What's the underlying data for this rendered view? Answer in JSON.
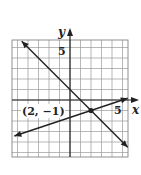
{
  "chart_data": {
    "type": "line",
    "title": "",
    "xlabel": "x",
    "ylabel": "y",
    "xlim": [
      -5.5,
      5.5
    ],
    "ylim": [
      -5.4,
      5.7
    ],
    "grid": true,
    "tick_labels": {
      "x": [
        "5"
      ],
      "y": [
        "5"
      ]
    },
    "series": [
      {
        "name": "line-decreasing",
        "equation": "y = -x + 1",
        "x": [
          -4.6,
          2,
          5.5
        ],
        "y": [
          5.6,
          -1,
          -4.5
        ]
      },
      {
        "name": "line-increasing",
        "equation": "y = (x - 5)/3",
        "x": [
          -5.3,
          2,
          5.5
        ],
        "y": [
          -3.43,
          -1,
          0.17
        ]
      }
    ],
    "annotations": [
      {
        "text": "(2, −1)",
        "x": 2,
        "y": -1,
        "marker": "point"
      }
    ]
  },
  "labels": {
    "x_axis": "x",
    "y_axis": "y",
    "x_tick": "5",
    "y_tick": "5",
    "point": "(2, −1)"
  }
}
